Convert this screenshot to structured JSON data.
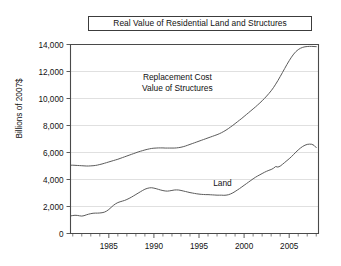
{
  "chart_data": {
    "type": "line",
    "title": "Real Value of Residential Land and Structures",
    "xlabel": "",
    "ylabel": "Billions of 2007$",
    "ylim": [
      0,
      14000
    ],
    "xlim": [
      1980.75,
      2008.25
    ],
    "yticks": [
      0,
      2000,
      4000,
      6000,
      8000,
      10000,
      12000,
      14000
    ],
    "ytick_labels": [
      "0",
      "2,000",
      "4,000",
      "6,000",
      "8,000",
      "10,000",
      "12,000",
      "14,000"
    ],
    "xticks": [
      1985,
      1990,
      1995,
      2000,
      2005
    ],
    "xtick_labels": [
      "1985",
      "1990",
      "1995",
      "2000",
      "2005"
    ],
    "xticks_minor": [
      1981,
      1982,
      1983,
      1984,
      1986,
      1987,
      1988,
      1989,
      1991,
      1992,
      1993,
      1994,
      1996,
      1997,
      1998,
      1999,
      2001,
      2002,
      2003,
      2004,
      2006,
      2007,
      2008
    ],
    "grid": "horizontal",
    "legend_position": "inline-annotations",
    "annotations": [
      {
        "name": "structures-annotation",
        "lines": [
          "Replacement Cost",
          "Value of Structures"
        ],
        "x": 1992.6,
        "y": 11400
      },
      {
        "name": "land-annotation",
        "lines": [
          "Land"
        ],
        "x": 1997.6,
        "y": 3550
      }
    ],
    "x": [
      1980.75,
      1981.0,
      1981.25,
      1981.5,
      1981.75,
      1982.0,
      1982.25,
      1982.5,
      1982.75,
      1983.0,
      1983.25,
      1983.5,
      1983.75,
      1984.0,
      1984.25,
      1984.5,
      1984.75,
      1985.0,
      1985.25,
      1985.5,
      1985.75,
      1986.0,
      1986.25,
      1986.5,
      1986.75,
      1987.0,
      1987.25,
      1987.5,
      1987.75,
      1988.0,
      1988.25,
      1988.5,
      1988.75,
      1989.0,
      1989.25,
      1989.5,
      1989.75,
      1990.0,
      1990.25,
      1990.5,
      1990.75,
      1991.0,
      1991.25,
      1991.5,
      1991.75,
      1992.0,
      1992.25,
      1992.5,
      1992.75,
      1993.0,
      1993.25,
      1993.5,
      1993.75,
      1994.0,
      1994.25,
      1994.5,
      1994.75,
      1995.0,
      1995.25,
      1995.5,
      1995.75,
      1996.0,
      1996.25,
      1996.5,
      1996.75,
      1997.0,
      1997.25,
      1997.5,
      1997.75,
      1998.0,
      1998.25,
      1998.5,
      1998.75,
      1999.0,
      1999.25,
      1999.5,
      1999.75,
      2000.0,
      2000.25,
      2000.5,
      2000.75,
      2001.0,
      2001.25,
      2001.5,
      2001.75,
      2002.0,
      2002.25,
      2002.5,
      2002.75,
      2003.0,
      2003.25,
      2003.5,
      2003.75,
      2004.0,
      2004.25,
      2004.5,
      2004.75,
      2005.0,
      2005.25,
      2005.5,
      2005.75,
      2006.0,
      2006.25,
      2006.5,
      2006.75,
      2007.0,
      2007.25,
      2007.5,
      2007.75,
      2008.0
    ],
    "series": [
      {
        "name": "Replacement Cost Value of Structures",
        "color": "#5b5b5b",
        "values": [
          5060,
          5060,
          5050,
          5040,
          5030,
          5020,
          5010,
          5000,
          5000,
          5010,
          5020,
          5040,
          5070,
          5110,
          5150,
          5200,
          5250,
          5300,
          5350,
          5400,
          5450,
          5500,
          5560,
          5620,
          5680,
          5740,
          5800,
          5860,
          5920,
          5980,
          6040,
          6090,
          6140,
          6190,
          6230,
          6270,
          6300,
          6320,
          6330,
          6340,
          6340,
          6340,
          6330,
          6330,
          6330,
          6330,
          6330,
          6340,
          6360,
          6390,
          6430,
          6480,
          6540,
          6600,
          6660,
          6720,
          6780,
          6840,
          6900,
          6960,
          7020,
          7080,
          7140,
          7200,
          7260,
          7320,
          7390,
          7470,
          7560,
          7660,
          7770,
          7890,
          8010,
          8140,
          8270,
          8400,
          8530,
          8670,
          8810,
          8950,
          9090,
          9230,
          9370,
          9520,
          9670,
          9830,
          10000,
          10180,
          10370,
          10570,
          10800,
          11060,
          11330,
          11620,
          11920,
          12220,
          12520,
          12800,
          13060,
          13290,
          13480,
          13620,
          13720,
          13790,
          13830,
          13850,
          13860,
          13860,
          13850,
          13840
        ]
      },
      {
        "name": "Land",
        "color": "#5b5b5b",
        "values": [
          1300,
          1330,
          1350,
          1340,
          1310,
          1290,
          1320,
          1380,
          1430,
          1470,
          1500,
          1510,
          1510,
          1520,
          1540,
          1580,
          1660,
          1780,
          1930,
          2080,
          2200,
          2290,
          2350,
          2400,
          2450,
          2520,
          2600,
          2690,
          2790,
          2890,
          2990,
          3090,
          3190,
          3280,
          3340,
          3380,
          3390,
          3360,
          3320,
          3270,
          3220,
          3180,
          3150,
          3140,
          3160,
          3190,
          3220,
          3230,
          3220,
          3190,
          3150,
          3110,
          3070,
          3030,
          3000,
          2970,
          2940,
          2920,
          2900,
          2890,
          2880,
          2880,
          2870,
          2860,
          2850,
          2840,
          2840,
          2840,
          2830,
          2840,
          2870,
          2930,
          3010,
          3110,
          3220,
          3330,
          3450,
          3570,
          3690,
          3810,
          3930,
          4050,
          4160,
          4260,
          4350,
          4440,
          4530,
          4610,
          4680,
          4740,
          4830,
          4960,
          4920,
          4990,
          5120,
          5260,
          5400,
          5540,
          5690,
          5860,
          6030,
          6190,
          6330,
          6450,
          6540,
          6600,
          6620,
          6610,
          6530,
          6360
        ]
      }
    ]
  }
}
